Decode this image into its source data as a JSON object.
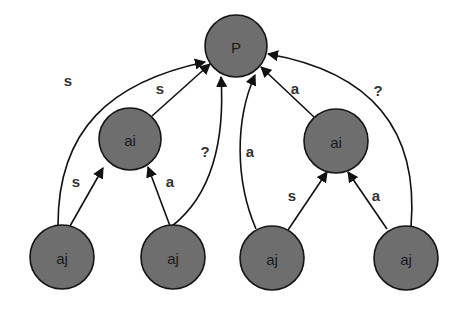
{
  "diagram": {
    "colors": {
      "node_fill": "#6e6e6e",
      "node_stroke": "#151515",
      "edge": "#111111",
      "label": "#333333"
    },
    "nodes": [
      {
        "id": "P",
        "label": "P",
        "cx": 236,
        "cy": 46,
        "r": 31
      },
      {
        "id": "ai1",
        "label": "ai",
        "cx": 130,
        "cy": 139,
        "r": 31
      },
      {
        "id": "ai2",
        "label": "ai",
        "cx": 336,
        "cy": 141,
        "r": 32
      },
      {
        "id": "aj1",
        "label": "aj",
        "cx": 62,
        "cy": 257,
        "r": 32
      },
      {
        "id": "aj2",
        "label": "aj",
        "cx": 173,
        "cy": 257,
        "r": 32
      },
      {
        "id": "aj3",
        "label": "aj",
        "cx": 272,
        "cy": 258,
        "r": 32
      },
      {
        "id": "aj4",
        "label": "aj",
        "cx": 406,
        "cy": 258,
        "r": 32
      }
    ],
    "edges": [
      {
        "from": "aj1",
        "to": "P",
        "label": "s",
        "label_x": 68,
        "label_y": 80
      },
      {
        "from": "ai1",
        "to": "P",
        "label": "s",
        "label_x": 160,
        "label_y": 88
      },
      {
        "from": "aj1",
        "to": "ai1",
        "label": "s",
        "label_x": 76,
        "label_y": 181
      },
      {
        "from": "aj2",
        "to": "ai1",
        "label": "a",
        "label_x": 170,
        "label_y": 181
      },
      {
        "from": "aj2",
        "to": "P",
        "label": "?",
        "label_x": 205,
        "label_y": 151
      },
      {
        "from": "aj3",
        "to": "P",
        "label": "a",
        "label_x": 250,
        "label_y": 151
      },
      {
        "from": "ai2",
        "to": "P",
        "label": "a",
        "label_x": 295,
        "label_y": 88
      },
      {
        "from": "aj4",
        "to": "P",
        "label": "?",
        "label_x": 378,
        "label_y": 90
      },
      {
        "from": "aj3",
        "to": "ai2",
        "label": "s",
        "label_x": 292,
        "label_y": 195
      },
      {
        "from": "aj4",
        "to": "ai2",
        "label": "a",
        "label_x": 376,
        "label_y": 195
      }
    ]
  }
}
